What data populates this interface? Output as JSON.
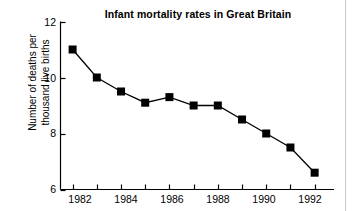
{
  "chart_data": {
    "type": "line",
    "title": "Infant mortality rates in Great Britain",
    "xlabel": "",
    "ylabel": "Number of deaths per thousand live births",
    "ylabel_line1": "Number of deaths per",
    "ylabel_line2": "thousand live births",
    "x": [
      1982,
      1983,
      1984,
      1985,
      1986,
      1987,
      1988,
      1989,
      1990,
      1991,
      1992
    ],
    "values": [
      11.0,
      10.0,
      9.5,
      9.1,
      9.3,
      9.0,
      9.0,
      8.5,
      8.0,
      7.5,
      6.6
    ],
    "categories": [
      "1982",
      "1983",
      "1984",
      "1985",
      "1986",
      "1987",
      "1988",
      "1989",
      "1990",
      "1991",
      "1992"
    ],
    "xlim": [
      1981.5,
      1992.8
    ],
    "ylim": [
      6,
      12
    ],
    "yticks": [
      6,
      8,
      10,
      12
    ],
    "ytick_labels": [
      "6",
      "8",
      "10",
      "12"
    ],
    "xticks": [
      1982,
      1983,
      1984,
      1985,
      1986,
      1987,
      1988,
      1989,
      1990,
      1991,
      1992
    ],
    "xtick_labels": [
      "1982",
      "",
      "1984",
      "",
      "1986",
      "",
      "1988",
      "",
      "1990",
      "",
      "1992"
    ],
    "xtick_labels_shown": [
      "1982",
      "1984",
      "1986",
      "1988",
      "1990",
      "1992"
    ],
    "grid": false,
    "legend": null,
    "legend_position": "none",
    "marker": "square",
    "line_color": "#000000",
    "marker_color": "#000000",
    "background_color": "#ffffff",
    "axis_color": "#000000"
  },
  "figure": {
    "border_color": "#c9c9c9"
  }
}
